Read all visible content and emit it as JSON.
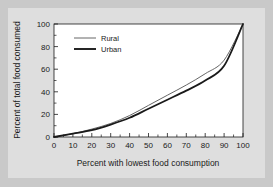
{
  "chart_data": {
    "type": "line",
    "title": "",
    "xlabel": "Percent with lowest food consumption",
    "ylabel": "Percent of total food consumed",
    "xlim": [
      0,
      100
    ],
    "ylim": [
      0,
      100
    ],
    "xticks": [
      "0",
      "10",
      "20",
      "30",
      "40",
      "50",
      "60",
      "70",
      "80",
      "90",
      "100"
    ],
    "yticks": [
      "0",
      "20",
      "40",
      "60",
      "80",
      "100"
    ],
    "grid": false,
    "legend_position": "top-left inside plot",
    "x": [
      0,
      10,
      20,
      30,
      40,
      50,
      60,
      70,
      80,
      90,
      100
    ],
    "series": [
      {
        "name": "Rural",
        "style": "thin line",
        "color": "#555555",
        "values": [
          0,
          3,
          7,
          12,
          19,
          28,
          37,
          46,
          56,
          68,
          100
        ]
      },
      {
        "name": "Urban",
        "style": "thick line",
        "color": "#1a1a1a",
        "values": [
          0,
          3,
          6,
          11,
          17,
          25,
          33,
          41,
          50,
          63,
          100
        ]
      }
    ]
  },
  "legend": {
    "items": [
      {
        "label": "Rural"
      },
      {
        "label": "Urban"
      }
    ]
  },
  "colors": {
    "page_background": "#c9c9c9",
    "panel_background": "#dedede",
    "axis": "#1a1a1a",
    "rural_line": "#555555",
    "urban_line": "#1a1a1a"
  }
}
